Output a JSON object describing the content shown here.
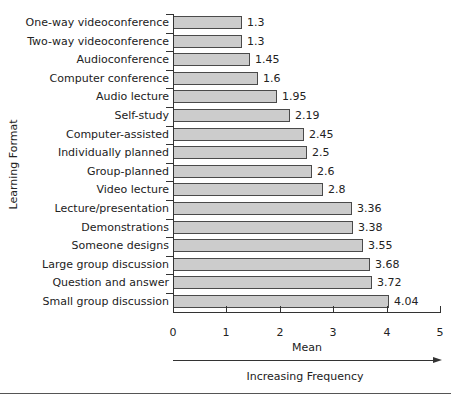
{
  "chart_data": {
    "type": "bar",
    "orientation": "horizontal",
    "title": "",
    "xlabel": "Mean",
    "ylabel": "Learning Format",
    "annotation": "Increasing Frequency",
    "xlim": [
      0,
      5
    ],
    "xticks": [
      "0",
      "1",
      "2",
      "3",
      "4",
      "5"
    ],
    "grid": false,
    "legend": null,
    "categories": [
      "One-way videoconference",
      "Two-way videoconference",
      "Audioconference",
      "Computer conference",
      "Audio lecture",
      "Self-study",
      "Computer-assisted",
      "Individually planned",
      "Group-planned",
      "Video lecture",
      "Lecture/presentation",
      "Demonstrations",
      "Someone designs",
      "Large group discussion",
      "Question and answer",
      "Small group discussion"
    ],
    "values": [
      1.3,
      1.3,
      1.45,
      1.6,
      1.95,
      2.19,
      2.45,
      2.5,
      2.6,
      2.8,
      3.36,
      3.38,
      3.55,
      3.68,
      3.72,
      4.04
    ],
    "value_labels": [
      "1.3",
      "1.3",
      "1.45",
      "1.6",
      "1.95",
      "2.19",
      "2.45",
      "2.5",
      "2.6",
      "2.8",
      "3.36",
      "3.38",
      "3.55",
      "3.68",
      "3.72",
      "4.04"
    ],
    "colors": {
      "bar_fill": "#cccccc",
      "bar_edge": "#4a4a4a",
      "axis": "#333333"
    }
  }
}
